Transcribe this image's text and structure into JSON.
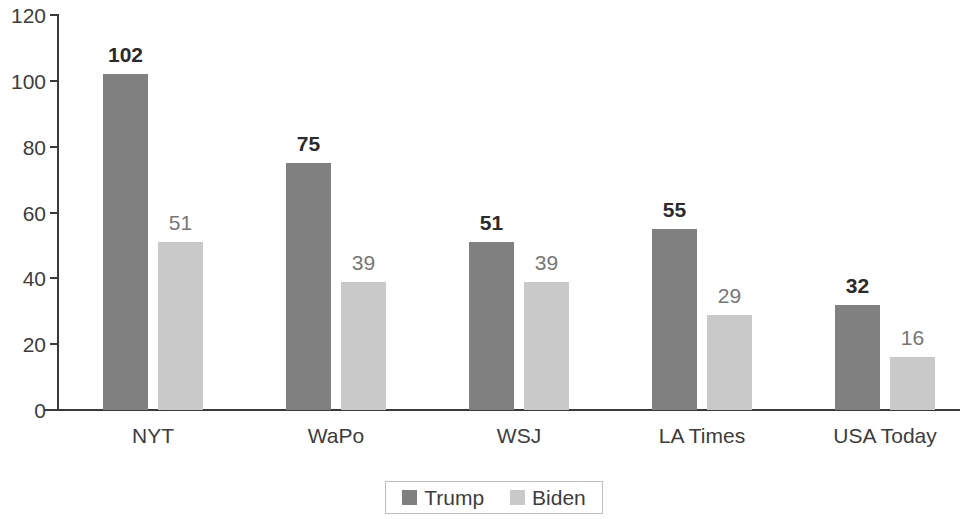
{
  "chart_data": {
    "type": "bar",
    "title": "",
    "subtitle": "",
    "xlabel": "",
    "ylabel": "",
    "categories": [
      "NYT",
      "WaPo",
      "WSJ",
      "LA Times",
      "USA Today"
    ],
    "series": [
      {
        "name": "Trump",
        "color": "#808080",
        "values": [
          102,
          75,
          51,
          55,
          32
        ]
      },
      {
        "name": "Biden",
        "color": "#c9c9c9",
        "values": [
          51,
          39,
          39,
          29,
          16
        ]
      }
    ],
    "ylim": [
      0,
      120
    ],
    "y_ticks": [
      0,
      20,
      40,
      60,
      80,
      100,
      120
    ],
    "y_tick_labels": [
      "0",
      "20",
      "40",
      "60",
      "80",
      "100",
      "120"
    ],
    "grid": false,
    "legend_position": "bottom-center",
    "data_labels": true,
    "axis_color": "#3a3a3a",
    "text_color": "#3c3c3c"
  },
  "legend": {
    "entries": [
      {
        "label": "Trump"
      },
      {
        "label": "Biden"
      }
    ]
  }
}
